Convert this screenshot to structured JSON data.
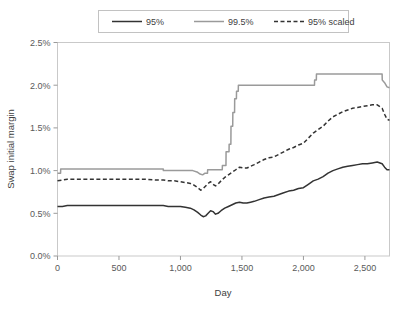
{
  "chart_data": {
    "type": "line",
    "title": "",
    "xlabel": "Day",
    "ylabel": "Swap initial margin",
    "xlim": [
      0,
      2700
    ],
    "ylim": [
      0,
      0.025
    ],
    "grid": false,
    "legend_position": "top",
    "x_ticks": [
      0,
      500,
      1000,
      1500,
      2000,
      2500
    ],
    "x_tick_labels": [
      "0",
      "500",
      "1,000",
      "1,500",
      "2,000",
      "2,500"
    ],
    "y_ticks": [
      0,
      0.005,
      0.01,
      0.015,
      0.02,
      0.025
    ],
    "y_tick_labels": [
      "0.0%",
      "0.5%",
      "1.0%",
      "1.5%",
      "2.0%",
      "2.5%"
    ],
    "series": [
      {
        "name": "95%",
        "color": "#333333",
        "dash": "none",
        "width": 1.5,
        "x": [
          0,
          40,
          80,
          120,
          200,
          300,
          400,
          500,
          600,
          700,
          800,
          860,
          900,
          950,
          1000,
          1040,
          1080,
          1110,
          1140,
          1165,
          1185,
          1205,
          1225,
          1245,
          1265,
          1285,
          1305,
          1330,
          1360,
          1390,
          1420,
          1450,
          1480,
          1510,
          1540,
          1570,
          1600,
          1640,
          1680,
          1720,
          1760,
          1800,
          1840,
          1880,
          1920,
          1960,
          2000,
          2040,
          2080,
          2120,
          2160,
          2200,
          2240,
          2280,
          2320,
          2360,
          2400,
          2440,
          2480,
          2520,
          2560,
          2600,
          2640,
          2660,
          2680,
          2700
        ],
        "values": [
          0.0058,
          0.0058,
          0.0059,
          0.0059,
          0.0059,
          0.0059,
          0.0059,
          0.0059,
          0.0059,
          0.0059,
          0.0059,
          0.0059,
          0.0058,
          0.0058,
          0.0058,
          0.0057,
          0.0056,
          0.0054,
          0.0051,
          0.0048,
          0.0046,
          0.0047,
          0.005,
          0.0053,
          0.0052,
          0.0049,
          0.005,
          0.0053,
          0.0056,
          0.0058,
          0.006,
          0.0062,
          0.0063,
          0.0062,
          0.0062,
          0.0063,
          0.0064,
          0.0066,
          0.0068,
          0.0069,
          0.007,
          0.0072,
          0.0074,
          0.0076,
          0.0077,
          0.0079,
          0.008,
          0.0084,
          0.0088,
          0.009,
          0.0093,
          0.0097,
          0.01,
          0.0102,
          0.0104,
          0.0105,
          0.0106,
          0.0107,
          0.0108,
          0.0108,
          0.0109,
          0.011,
          0.0108,
          0.0104,
          0.0101,
          0.0101
        ]
      },
      {
        "name": "99.5%",
        "color": "#9a9a9a",
        "dash": "none",
        "width": 1.5,
        "x": [
          0,
          25,
          26,
          120,
          300,
          500,
          700,
          860,
          861,
          1000,
          1100,
          1140,
          1160,
          1180,
          1200,
          1220,
          1221,
          1300,
          1340,
          1341,
          1370,
          1371,
          1395,
          1396,
          1410,
          1411,
          1425,
          1426,
          1440,
          1441,
          1455,
          1456,
          1470,
          1471,
          2090,
          2091,
          2105,
          2106,
          2560,
          2640,
          2641,
          2660,
          2680,
          2700
        ],
        "values": [
          0.0097,
          0.0097,
          0.0102,
          0.0102,
          0.0102,
          0.0102,
          0.0102,
          0.0102,
          0.01,
          0.01,
          0.01,
          0.0098,
          0.0096,
          0.0095,
          0.0097,
          0.0097,
          0.0101,
          0.0101,
          0.0101,
          0.0106,
          0.0106,
          0.0122,
          0.0122,
          0.0131,
          0.0131,
          0.0152,
          0.0152,
          0.0168,
          0.0168,
          0.0184,
          0.0184,
          0.0193,
          0.0193,
          0.02,
          0.02,
          0.0206,
          0.0206,
          0.0213,
          0.0213,
          0.0213,
          0.0206,
          0.0203,
          0.0198,
          0.0197
        ]
      },
      {
        "name": "95% scaled",
        "color": "#333333",
        "dash": "4,2.5",
        "width": 1.5,
        "x": [
          0,
          40,
          80,
          120,
          200,
          300,
          400,
          500,
          600,
          700,
          800,
          860,
          900,
          950,
          1000,
          1040,
          1080,
          1110,
          1140,
          1165,
          1185,
          1205,
          1225,
          1245,
          1265,
          1285,
          1305,
          1330,
          1360,
          1390,
          1420,
          1450,
          1480,
          1510,
          1540,
          1570,
          1600,
          1640,
          1680,
          1720,
          1760,
          1800,
          1840,
          1880,
          1920,
          1960,
          2000,
          2040,
          2080,
          2120,
          2160,
          2200,
          2240,
          2280,
          2320,
          2360,
          2400,
          2440,
          2480,
          2520,
          2560,
          2600,
          2640,
          2660,
          2680,
          2700
        ],
        "values": [
          0.0088,
          0.0089,
          0.009,
          0.009,
          0.009,
          0.009,
          0.009,
          0.009,
          0.009,
          0.009,
          0.0089,
          0.0089,
          0.0088,
          0.0088,
          0.0087,
          0.0086,
          0.0085,
          0.0083,
          0.008,
          0.0077,
          0.0079,
          0.0082,
          0.0085,
          0.0087,
          0.0084,
          0.0082,
          0.0084,
          0.0088,
          0.0092,
          0.0095,
          0.0098,
          0.0101,
          0.0104,
          0.0103,
          0.0103,
          0.0105,
          0.0107,
          0.011,
          0.0113,
          0.0115,
          0.0116,
          0.0119,
          0.0122,
          0.0125,
          0.0127,
          0.013,
          0.0132,
          0.0138,
          0.0144,
          0.0148,
          0.0152,
          0.0158,
          0.0163,
          0.0166,
          0.0169,
          0.0171,
          0.0173,
          0.0174,
          0.0175,
          0.0176,
          0.0177,
          0.0177,
          0.0173,
          0.0166,
          0.016,
          0.0159
        ]
      }
    ]
  },
  "legend": {
    "items": [
      {
        "label": "95%"
      },
      {
        "label": "99.5%"
      },
      {
        "label": "95% scaled"
      }
    ]
  }
}
